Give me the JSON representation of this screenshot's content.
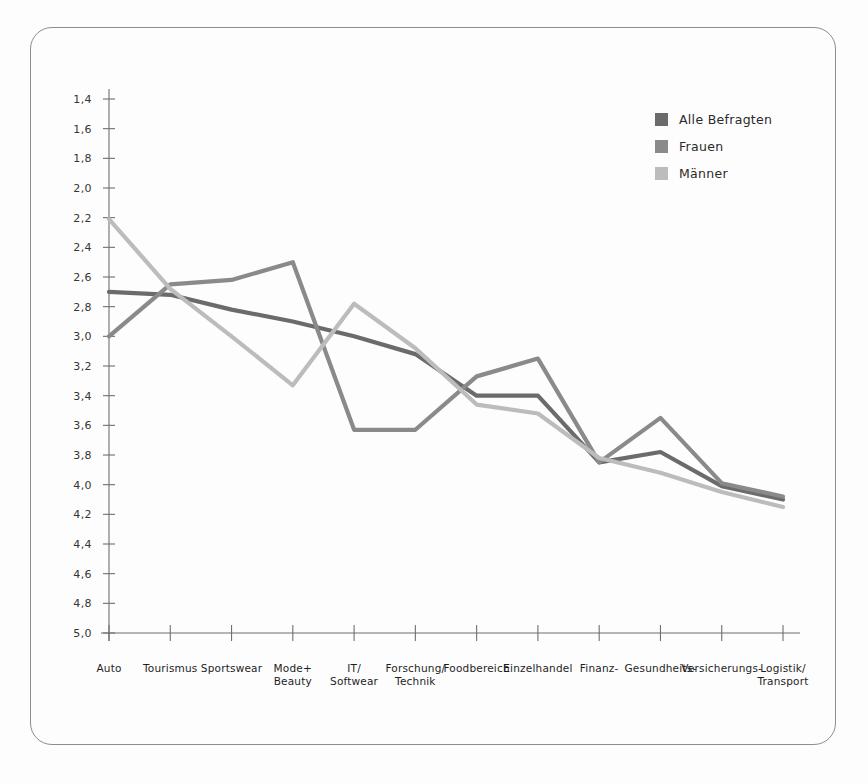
{
  "chart_data": {
    "type": "line",
    "title": "",
    "subtitle": "",
    "xlabel": "",
    "ylabel": "",
    "grid": false,
    "y_axis_inverted": true,
    "ylim": [
      1.4,
      5.0
    ],
    "y_tick_step": 0.2,
    "y_ticks": [
      "1,4",
      "1,6",
      "1,8",
      "2,0",
      "2,2",
      "2,4",
      "2,6",
      "2,8",
      "3,0",
      "3,2",
      "3,4",
      "3,6",
      "3,8",
      "4,0",
      "4,2",
      "4,4",
      "4,6",
      "4,8",
      "5,0"
    ],
    "y_tick_values": [
      1.4,
      1.6,
      1.8,
      2.0,
      2.2,
      2.4,
      2.6,
      2.8,
      3.0,
      3.2,
      3.4,
      3.6,
      3.8,
      4.0,
      4.2,
      4.4,
      4.6,
      4.8,
      5.0
    ],
    "categories": [
      "Auto",
      "Tourismus",
      "Sportswear",
      "Mode+\nBeauty",
      "IT/\nSoftwear",
      "Forschung/\nTechnik",
      "Foodbereich",
      "Einzelhandel",
      "Finanz-",
      "Gesundheits-",
      "Versicherungs-",
      "Logistik/\nTransport"
    ],
    "legend_position": "top-right",
    "series": [
      {
        "name": "Alle Befragten",
        "color": "#6b6b6b",
        "values": [
          2.7,
          2.72,
          2.82,
          2.9,
          3.0,
          3.12,
          3.4,
          3.4,
          3.85,
          3.78,
          4.01,
          4.1
        ]
      },
      {
        "name": "Frauen",
        "color": "#8a8a8a",
        "values": [
          3.0,
          2.65,
          2.62,
          2.5,
          3.63,
          3.63,
          3.27,
          3.15,
          3.85,
          3.55,
          3.99,
          4.08
        ]
      },
      {
        "name": "Männer",
        "color": "#bcbcbc",
        "values": [
          2.21,
          2.68,
          3.0,
          3.33,
          2.78,
          3.08,
          3.46,
          3.52,
          3.82,
          3.92,
          4.05,
          4.15
        ]
      }
    ]
  },
  "legend": {
    "items": [
      {
        "label": "Alle Befragten",
        "color": "#6b6b6b"
      },
      {
        "label": "Frauen",
        "color": "#8a8a8a"
      },
      {
        "label": "Männer",
        "color": "#bcbcbc"
      }
    ]
  }
}
